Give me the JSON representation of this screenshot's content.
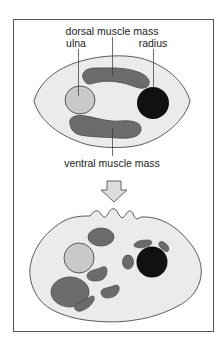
{
  "figure": {
    "labels": {
      "dorsal": "dorsal muscle mass",
      "ulna": "ulna",
      "radius": "radius",
      "ventral": "ventral muscle mass"
    },
    "colors": {
      "frame": "#555555",
      "body_fill": "#ebebeb",
      "muscle": "#6b6b6b",
      "ulna": "#c9c9c9",
      "radius": "#111111",
      "outline": "#4a4a4a",
      "arrow_fill": "#dcdcdc"
    }
  }
}
